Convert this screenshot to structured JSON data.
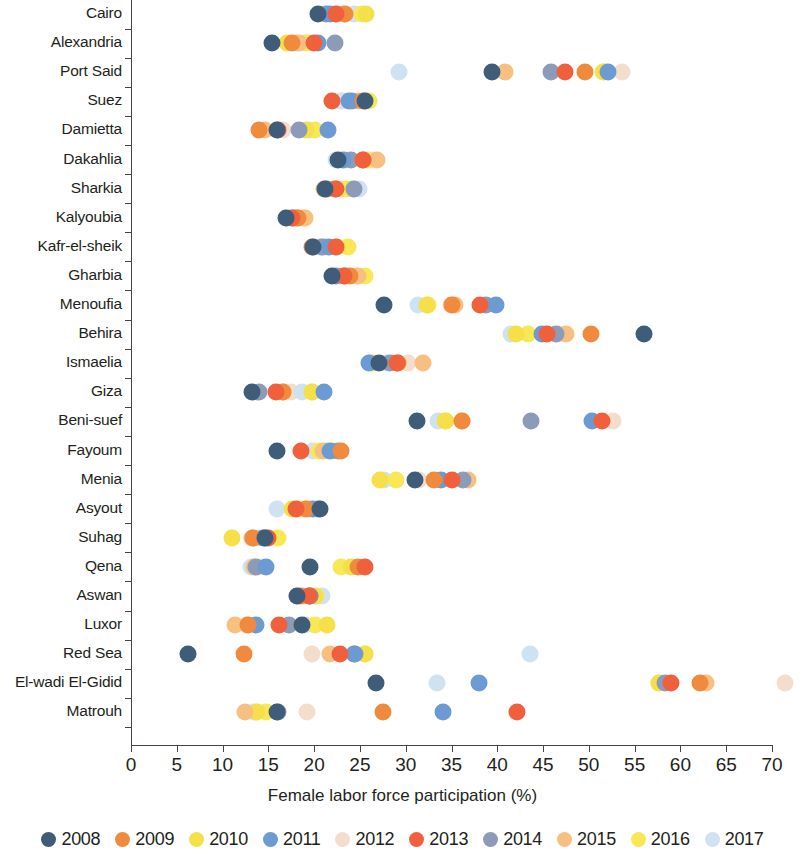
{
  "chart_data": {
    "type": "scatter",
    "title": "",
    "xlabel": "Female labor force participation (%)",
    "ylabel": "",
    "xlim": [
      0,
      70
    ],
    "xticks": [
      0,
      5,
      10,
      15,
      20,
      25,
      30,
      35,
      40,
      45,
      50,
      55,
      60,
      65,
      70
    ],
    "grid": false,
    "legend_position": "bottom",
    "categories": [
      "Cairo",
      "Alexandria",
      "Port Said",
      "Suez",
      "Damietta",
      "Dakahlia",
      "Sharkia",
      "Kalyoubia",
      "Kafr-el-sheik",
      "Gharbia",
      "Menoufia",
      "Behira",
      "Ismaelia",
      "Giza",
      "Beni-suef",
      "Fayoum",
      "Menia",
      "Asyout",
      "Suhag",
      "Qena",
      "Aswan",
      "Luxor",
      "Red Sea",
      "El-wadi El-Gidid",
      "Matrouh"
    ],
    "series": [
      {
        "name": "2008",
        "color": "#3f5d78",
        "values": [
          20.4,
          15.4,
          39.4,
          25.6,
          15.9,
          22.6,
          21.2,
          16.9,
          19.9,
          22.0,
          27.6,
          56.0,
          27.1,
          13.2,
          31.2,
          15.9,
          31.0,
          20.6,
          14.6,
          19.5,
          18.1,
          18.7,
          6.2,
          26.8,
          15.9
        ]
      },
      {
        "name": "2009",
        "color": "#f08a3c",
        "values": [
          23.4,
          17.6,
          49.6,
          25.3,
          14.0,
          25.3,
          22.3,
          18.2,
          19.8,
          23.9,
          35.0,
          50.2,
          29.2,
          16.6,
          36.1,
          22.9,
          33.1,
          19.1,
          13.3,
          24.8,
          18.5,
          12.8,
          12.3,
          62.1,
          27.5
        ]
      },
      {
        "name": "2010",
        "color": "#f5e04a",
        "values": [
          25.7,
          17.0,
          51.6,
          25.6,
          19.1,
          23.4,
          24.2,
          17.9,
          22.5,
          24.7,
          32.3,
          42.0,
          26.4,
          19.8,
          34.3,
          22.0,
          27.2,
          17.6,
          11.0,
          24.0,
          20.1,
          21.4,
          25.6,
          57.7,
          13.8
        ]
      },
      {
        "name": "2011",
        "color": "#6b9bd2",
        "values": [
          21.7,
          20.4,
          52.1,
          23.8,
          21.5,
          23.1,
          21.4,
          17.7,
          21.6,
          22.4,
          39.9,
          44.9,
          26.0,
          21.1,
          50.3,
          21.7,
          33.9,
          19.9,
          14.4,
          14.7,
          19.5,
          13.6,
          24.3,
          38.0,
          34.1
        ]
      },
      {
        "name": "2012",
        "color": "#f5ddcc",
        "values": [
          22.5,
          19.0,
          53.6,
          23.0,
          16.6,
          26.2,
          22.9,
          17.4,
          21.3,
          23.6,
          34.9,
          46.7,
          30.2,
          17.5,
          52.6,
          21.3,
          31.4,
          18.9,
          15.2,
          14.0,
          18.1,
          12.6,
          19.8,
          71.4,
          19.2
        ]
      },
      {
        "name": "2013",
        "color": "#f0603c",
        "values": [
          22.4,
          20.0,
          47.4,
          22.0,
          16.1,
          25.3,
          22.4,
          17.6,
          22.4,
          23.3,
          38.1,
          45.4,
          29.0,
          15.8,
          51.4,
          18.6,
          35.0,
          18.0,
          15.0,
          25.6,
          19.4,
          16.2,
          22.8,
          59.0,
          42.1
        ]
      },
      {
        "name": "2014",
        "color": "#8b9bb8",
        "values": [
          21.3,
          22.3,
          45.9,
          24.1,
          18.4,
          24.0,
          24.3,
          18.1,
          20.9,
          23.4,
          38.8,
          46.4,
          28.3,
          14.0,
          43.7,
          22.6,
          36.3,
          20.4,
          14.6,
          13.6,
          19.5,
          17.2,
          24.5,
          58.3,
          16.0
        ]
      },
      {
        "name": "2015",
        "color": "#f8c080",
        "values": [
          23.3,
          18.4,
          40.8,
          24.8,
          14.6,
          26.9,
          21.1,
          19.0,
          21.0,
          24.8,
          35.4,
          47.5,
          31.9,
          16.6,
          36.2,
          21.0,
          36.8,
          19.4,
          13.2,
          13.4,
          18.8,
          11.4,
          21.7,
          62.8,
          12.5
        ]
      },
      {
        "name": "2016",
        "color": "#f9e855",
        "values": [
          25.2,
          19.2,
          51.5,
          26.0,
          20.1,
          25.8,
          23.5,
          18.8,
          23.7,
          25.6,
          32.4,
          43.3,
          26.3,
          19.8,
          34.4,
          20.5,
          28.9,
          18.5,
          16.0,
          22.9,
          20.2,
          20.1,
          25.6,
          57.7,
          14.7
        ]
      },
      {
        "name": "2017",
        "color": "#cfe2f2",
        "values": [
          24.3,
          18.1,
          29.3,
          22.9,
          19.4,
          22.4,
          24.9,
          17.0,
          20.6,
          22.8,
          31.3,
          41.5,
          27.9,
          18.7,
          33.5,
          19.9,
          27.6,
          15.9,
          13.9,
          13.1,
          20.9,
          19.0,
          43.6,
          33.4,
          13.4
        ]
      }
    ]
  },
  "axis": {
    "x_title": "Female labor force participation (%)",
    "tick_labels": [
      "0",
      "5",
      "10",
      "15",
      "20",
      "25",
      "30",
      "35",
      "40",
      "45",
      "50",
      "55",
      "60",
      "65",
      "70"
    ]
  },
  "legend": {
    "items": [
      {
        "label": "2008",
        "color": "#3f5d78"
      },
      {
        "label": "2009",
        "color": "#f08a3c"
      },
      {
        "label": "2010",
        "color": "#f5e04a"
      },
      {
        "label": "2011",
        "color": "#6b9bd2"
      },
      {
        "label": "2012",
        "color": "#f5ddcc"
      },
      {
        "label": "2013",
        "color": "#f0603c"
      },
      {
        "label": "2014",
        "color": "#8b9bb8"
      },
      {
        "label": "2015",
        "color": "#f8c080"
      },
      {
        "label": "2016",
        "color": "#f9e855"
      },
      {
        "label": "2017",
        "color": "#cfe2f2"
      }
    ]
  }
}
